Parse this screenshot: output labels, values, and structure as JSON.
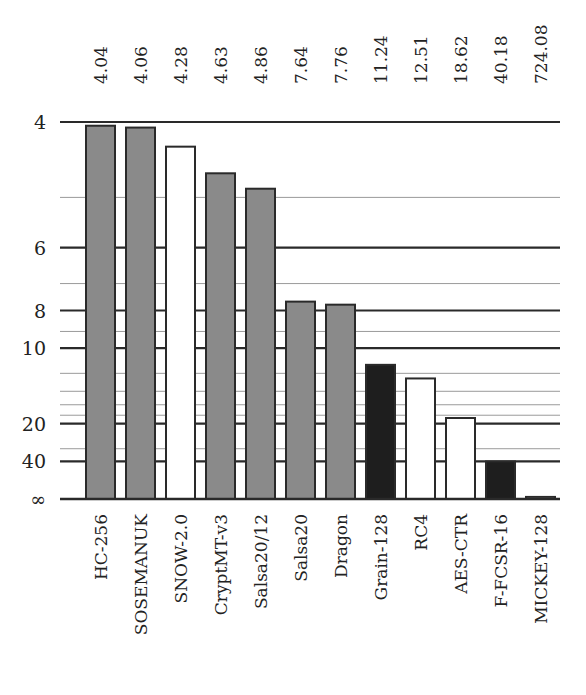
{
  "chart_data": {
    "type": "bar",
    "title": "",
    "xlabel": "",
    "ylabel": "",
    "y_scale": "reciprocal (1/x), top = 4, bottom = infinity",
    "ylim": [
      4,
      "infinity"
    ],
    "grid": true,
    "legend": null,
    "categories": [
      "HC-256",
      "SOSEMANUK",
      "SNOW-2.0",
      "CryptMT-v3",
      "Salsa20/12",
      "Salsa20",
      "Dragon",
      "Grain-128",
      "RC4",
      "AES-CTR",
      "F-FCSR-16",
      "MICKEY-128"
    ],
    "values": [
      4.04,
      4.06,
      4.28,
      4.63,
      4.86,
      7.64,
      7.76,
      11.24,
      12.51,
      18.62,
      40.18,
      724.08
    ],
    "value_labels": [
      "4.04",
      "4.06",
      "4.28",
      "4.63",
      "4.86",
      "7.64",
      "7.76",
      "11.24",
      "12.51",
      "18.62",
      "40.18",
      "724.08"
    ],
    "bar_fills": [
      "gray",
      "gray",
      "white",
      "gray",
      "gray",
      "gray",
      "gray",
      "black",
      "white",
      "white",
      "black",
      "white"
    ],
    "y_major_ticks": [
      {
        "value": 4,
        "label": "4"
      },
      {
        "value": 6,
        "label": "6"
      },
      {
        "value": 8,
        "label": "8"
      },
      {
        "value": 10,
        "label": "10"
      },
      {
        "value": 20,
        "label": "20"
      },
      {
        "value": 40,
        "label": "40"
      },
      {
        "value": "inf",
        "label": "∞"
      }
    ],
    "y_minor_ticks": [
      5,
      7,
      9,
      12,
      14,
      16,
      18,
      30
    ]
  },
  "colors": {
    "gray": "#8a8a8a",
    "white": "#ffffff",
    "black": "#1e1e1e",
    "stroke": "#2a2a2a",
    "major_grid": "#2a2a2a",
    "minor_grid": "#9a9a9a"
  }
}
